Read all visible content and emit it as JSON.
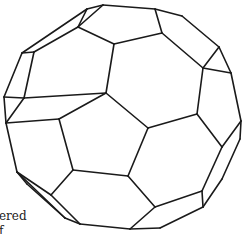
{
  "figure": {
    "stroke_color": "#1a1a1a",
    "background": "#ffffff",
    "vertices": {
      "A": [
        87,
        9
      ],
      "B": [
        103,
        5
      ],
      "C": [
        155,
        9
      ],
      "D": [
        182,
        16
      ],
      "E": [
        78,
        27
      ],
      "F": [
        114,
        44
      ],
      "G": [
        162,
        33
      ],
      "H": [
        22,
        53
      ],
      "I": [
        34,
        52
      ],
      "J": [
        219,
        47
      ],
      "K": [
        203,
        68
      ],
      "L": [
        231,
        73
      ],
      "M": [
        4,
        97
      ],
      "N": [
        24,
        98
      ],
      "O": [
        106,
        93
      ],
      "P": [
        59,
        119
      ],
      "Q": [
        6,
        123
      ],
      "R": [
        148,
        128
      ],
      "S": [
        197,
        114
      ],
      "T": [
        241,
        121
      ],
      "U": [
        240,
        139
      ],
      "V": [
        222,
        147
      ],
      "W": [
        17,
        172
      ],
      "X": [
        27,
        184
      ],
      "Y": [
        73,
        170
      ],
      "Z": [
        128,
        176
      ],
      "a": [
        51,
        195
      ],
      "b": [
        65,
        218
      ],
      "c": [
        80,
        224
      ],
      "d": [
        155,
        207
      ],
      "e": [
        202,
        191
      ],
      "f": [
        203,
        207
      ],
      "g": [
        222,
        179
      ],
      "h": [
        130,
        229
      ],
      "i": [
        160,
        228
      ]
    },
    "edges": [
      [
        "A",
        "B"
      ],
      [
        "B",
        "C"
      ],
      [
        "C",
        "D"
      ],
      [
        "D",
        "J"
      ],
      [
        "J",
        "L"
      ],
      [
        "L",
        "T"
      ],
      [
        "T",
        "U"
      ],
      [
        "U",
        "g"
      ],
      [
        "g",
        "f"
      ],
      [
        "f",
        "i"
      ],
      [
        "i",
        "h"
      ],
      [
        "h",
        "c"
      ],
      [
        "c",
        "b"
      ],
      [
        "b",
        "X"
      ],
      [
        "X",
        "W"
      ],
      [
        "W",
        "Q"
      ],
      [
        "Q",
        "M"
      ],
      [
        "M",
        "H"
      ],
      [
        "H",
        "A"
      ],
      [
        "H",
        "I"
      ],
      [
        "I",
        "E"
      ],
      [
        "E",
        "B"
      ],
      [
        "E",
        "A"
      ],
      [
        "I",
        "N"
      ],
      [
        "N",
        "M"
      ],
      [
        "E",
        "F"
      ],
      [
        "F",
        "G"
      ],
      [
        "G",
        "C"
      ],
      [
        "G",
        "K"
      ],
      [
        "K",
        "J"
      ],
      [
        "K",
        "L"
      ],
      [
        "F",
        "O"
      ],
      [
        "O",
        "N"
      ],
      [
        "N",
        "Q"
      ],
      [
        "O",
        "R"
      ],
      [
        "O",
        "P"
      ],
      [
        "P",
        "Q"
      ],
      [
        "K",
        "S"
      ],
      [
        "S",
        "R"
      ],
      [
        "S",
        "V"
      ],
      [
        "V",
        "T"
      ],
      [
        "V",
        "e"
      ],
      [
        "e",
        "f"
      ],
      [
        "e",
        "d"
      ],
      [
        "R",
        "Z"
      ],
      [
        "Z",
        "d"
      ],
      [
        "Z",
        "Y"
      ],
      [
        "Y",
        "P"
      ],
      [
        "Y",
        "a"
      ],
      [
        "a",
        "W"
      ],
      [
        "a",
        "c"
      ],
      [
        "d",
        "h"
      ],
      [
        "b",
        "W"
      ]
    ]
  },
  "caption": {
    "line1": "ered",
    "line2": "f"
  }
}
